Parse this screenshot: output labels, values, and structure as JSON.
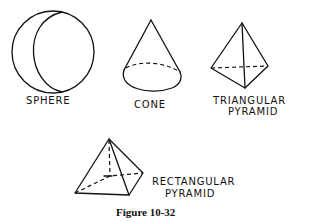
{
  "figure": {
    "caption": "Figure 10-32",
    "shapes": [
      {
        "id": "sphere",
        "label": "SPHERE"
      },
      {
        "id": "cone",
        "label": "CONE"
      },
      {
        "id": "triangular-pyramid",
        "label_line1": "TRIANGULAR",
        "label_line2": "PYRAMID"
      },
      {
        "id": "rectangular-pyramid",
        "label_line1": "RECTANGULAR",
        "label_line2": "PYRAMID"
      }
    ]
  }
}
